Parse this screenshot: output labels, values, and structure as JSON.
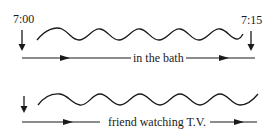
{
  "diagram": {
    "timeline_top": {
      "start_time": "7:00",
      "end_time": "7:15",
      "label": "in the bath"
    },
    "timeline_bottom": {
      "label": "friend watching T.V."
    },
    "colors": {
      "ink": "#1a1a1a",
      "background": "#ffffff"
    }
  }
}
